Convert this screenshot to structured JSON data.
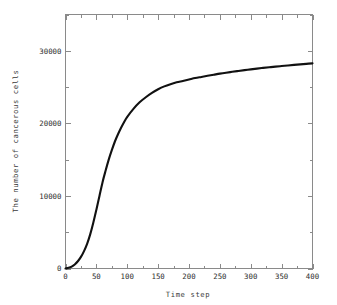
{
  "chart_data": {
    "type": "line",
    "title": "",
    "xlabel": "Time step",
    "ylabel": "The number of cancerous cells",
    "xlim": [
      0,
      400
    ],
    "ylim": [
      0,
      35000
    ],
    "grid": false,
    "legend": null,
    "x_ticks": [
      0,
      50,
      100,
      150,
      200,
      250,
      300,
      350,
      400
    ],
    "x_tick_labels": [
      "0",
      "50",
      "100",
      "150",
      "200",
      "250",
      "300",
      "350",
      "400"
    ],
    "x_minor_ticks": [
      25,
      75,
      125,
      175,
      225,
      275,
      325,
      375
    ],
    "y_ticks": [
      0,
      10000,
      20000,
      30000
    ],
    "y_tick_labels": [
      "0",
      "10000",
      "20000",
      "30000"
    ],
    "y_minor_ticks": [
      5000,
      15000,
      25000,
      35000
    ],
    "series": [
      {
        "name": "cancerous cells",
        "color": "#111111",
        "x": [
          0,
          5,
          10,
          15,
          20,
          25,
          30,
          35,
          40,
          45,
          50,
          55,
          60,
          65,
          70,
          75,
          80,
          85,
          90,
          95,
          100,
          110,
          120,
          130,
          140,
          150,
          160,
          170,
          180,
          190,
          200,
          210,
          220,
          230,
          240,
          250,
          260,
          270,
          280,
          290,
          300,
          310,
          320,
          330,
          340,
          350,
          360,
          370,
          380,
          390,
          400
        ],
        "values": [
          0,
          90,
          260,
          560,
          1000,
          1600,
          2400,
          3400,
          4700,
          6300,
          8100,
          10000,
          11900,
          13500,
          15000,
          16300,
          17500,
          18500,
          19400,
          20200,
          20900,
          22000,
          22900,
          23600,
          24200,
          24700,
          25100,
          25400,
          25650,
          25850,
          26050,
          26250,
          26400,
          26550,
          26700,
          26850,
          26980,
          27100,
          27220,
          27330,
          27440,
          27540,
          27640,
          27730,
          27820,
          27900,
          27980,
          28060,
          28130,
          28200,
          28270
        ]
      }
    ]
  },
  "axes": {
    "x_title": "Time step",
    "y_title": "The number of cancerous cells"
  }
}
